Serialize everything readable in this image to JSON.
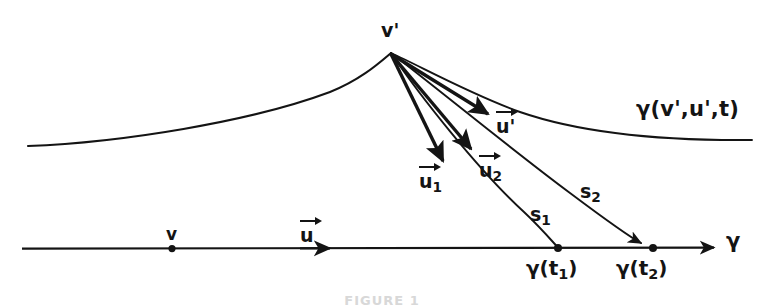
{
  "figure": {
    "kind": "geodesic-diagram",
    "ink_color": "#141414",
    "background_color": "#ffffff",
    "caption": "FIGURE 1",
    "labels": {
      "apex_point": "v'",
      "baseline_point": "v",
      "baseline_axis": "γ",
      "baseline_vector": "u",
      "upper_curve": "γ(v',u',t)",
      "upper_curve_vector": "u'",
      "vector_1_base": "u",
      "vector_1_sub": "1",
      "vector_2_base": "u",
      "vector_2_sub": "2",
      "segment_1_base": "s",
      "segment_1_sub": "1",
      "segment_2_base": "s",
      "segment_2_sub": "2",
      "foot_1_base": "γ(t",
      "foot_1_sub": "1",
      "foot_1_close": ")",
      "foot_2_base": "γ(t",
      "foot_2_sub": "2",
      "foot_2_close": ")"
    },
    "geometry": {
      "apex": [
        391,
        53
      ],
      "baseline_y": 248,
      "baseline_x_start": 22,
      "baseline_x_end": 718,
      "point_v": [
        172,
        249
      ],
      "foot_1": [
        558,
        248
      ],
      "foot_2": [
        653,
        248
      ],
      "upper_curve_left_end": [
        28,
        146
      ],
      "upper_curve_right_end": [
        752,
        140
      ],
      "vector_u_tip": [
        330,
        248
      ],
      "vector_u1_tip": [
        444,
        164
      ],
      "vector_u2_tip": [
        475,
        153
      ],
      "vector_uprime_tip": [
        492,
        116
      ]
    }
  }
}
